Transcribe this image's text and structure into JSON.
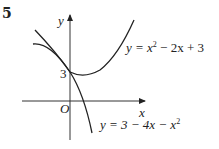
{
  "question_number": "5",
  "axes": {
    "x_label": "x",
    "y_label": "y",
    "origin_label": "O"
  },
  "intercept_label": "3",
  "curves": [
    {
      "name": "upward-parabola",
      "equation_lhs": "y = x",
      "equation_sup": "2",
      "equation_rest": " − 2x + 3"
    },
    {
      "name": "downward-parabola",
      "equation_lhs": "y = 3 − 4x − x",
      "equation_sup": "2",
      "equation_rest": ""
    }
  ],
  "colors": {
    "ink": "#222222",
    "background": "#ffffff"
  }
}
